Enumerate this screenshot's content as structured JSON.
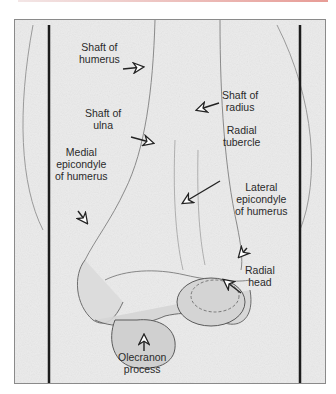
{
  "figure": {
    "accent_line_color": "#e79c96",
    "background": "#ebebeb",
    "labels": {
      "shaft_humerus": [
        "Shaft of",
        "humerus"
      ],
      "shaft_radius": [
        "Shaft of",
        "radius"
      ],
      "shaft_ulna": [
        "Shaft of",
        "ulna"
      ],
      "radial_tubercle": [
        "Radial",
        "tubercle"
      ],
      "medial_epicondyle": [
        "Medial",
        "epicondyle",
        "of humerus"
      ],
      "lateral_epicondyle": [
        "Lateral",
        "epicondyle",
        "of humerus"
      ],
      "radial_head": [
        "Radial",
        "head"
      ],
      "olecranon": [
        "Olecranon",
        "process"
      ]
    }
  }
}
